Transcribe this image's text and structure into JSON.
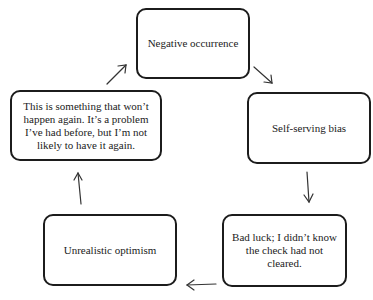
{
  "diagram": {
    "type": "cycle",
    "nodes": [
      {
        "id": "top",
        "label": "Negative occurrence"
      },
      {
        "id": "right",
        "label": "Self-serving bias"
      },
      {
        "id": "bottom_right",
        "label": "Bad luck; I didn’t know the check had not cleared."
      },
      {
        "id": "bottom_left",
        "label": "Unrealistic optimism"
      },
      {
        "id": "left",
        "label": "This is something that won’t happen again. It’s a problem I’ve had before, but I’m not likely to have it again."
      }
    ],
    "edges": [
      {
        "from": "top",
        "to": "right"
      },
      {
        "from": "right",
        "to": "bottom_right"
      },
      {
        "from": "bottom_right",
        "to": "bottom_left"
      },
      {
        "from": "bottom_left",
        "to": "left"
      },
      {
        "from": "left",
        "to": "top"
      }
    ]
  }
}
